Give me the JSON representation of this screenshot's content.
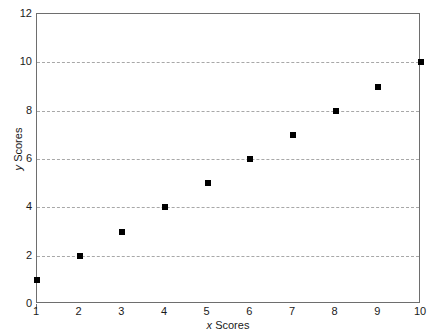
{
  "chart_data": {
    "type": "scatter",
    "title": "",
    "xlabel": "x Scores",
    "ylabel": "y Scores",
    "xlabel_italic_prefix": "x",
    "xlabel_rest": " Scores",
    "ylabel_italic_prefix": "y",
    "ylabel_rest": " Scores",
    "x": [
      1,
      2,
      3,
      4,
      5,
      6,
      7,
      8,
      9,
      10
    ],
    "y": [
      1,
      2,
      3,
      4,
      5,
      6,
      7,
      8,
      9,
      10
    ],
    "points": [
      {
        "x": 1,
        "y": 1
      },
      {
        "x": 2,
        "y": 2
      },
      {
        "x": 3,
        "y": 3
      },
      {
        "x": 4,
        "y": 4
      },
      {
        "x": 5,
        "y": 5
      },
      {
        "x": 6,
        "y": 6
      },
      {
        "x": 7,
        "y": 7
      },
      {
        "x": 8,
        "y": 8
      },
      {
        "x": 9,
        "y": 9
      },
      {
        "x": 10,
        "y": 10
      }
    ],
    "xlim": [
      1,
      10
    ],
    "ylim": [
      0,
      12
    ],
    "xticks": [
      1,
      2,
      3,
      4,
      5,
      6,
      7,
      8,
      9,
      10
    ],
    "xtick_labels": [
      "1",
      "2",
      "3",
      "4",
      "5",
      "6",
      "7",
      "8",
      "9",
      "10"
    ],
    "yticks": [
      0,
      2,
      4,
      6,
      8,
      10,
      12
    ],
    "ytick_labels": [
      "0",
      "2",
      "4",
      "6",
      "8",
      "10",
      "12"
    ],
    "gridlines_y": [
      2,
      4,
      6,
      8,
      10
    ],
    "grid": true,
    "grid_axis": "y",
    "grid_style": "dashed",
    "legend": null,
    "marker_shape": "square",
    "marker_color": "#000000",
    "grid_color": "#a8a8a8",
    "frame_color": "#6e6e6e",
    "background_color": "#ffffff"
  }
}
